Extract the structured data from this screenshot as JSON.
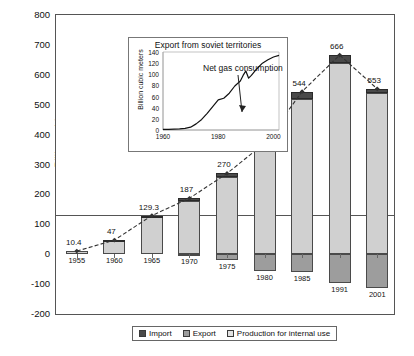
{
  "chart_data": {
    "type": "bar",
    "title": "",
    "xlabel": "",
    "ylabel": "Billion cubic meters",
    "ylim": [
      -200,
      800
    ],
    "yticks": [
      800,
      700,
      600,
      500,
      400,
      300,
      200,
      100,
      0,
      -100,
      -200
    ],
    "categories": [
      "1955",
      "1960",
      "1965",
      "1970",
      "1975",
      "1980",
      "1985",
      "1991",
      "2001"
    ],
    "grid": false,
    "legend_position": "bottom",
    "series": [
      {
        "name": "Production for internal use",
        "color": "#d0d0d0",
        "values": [
          10.4,
          45,
          126,
          178,
          258,
          355,
          520,
          640,
          540
        ]
      },
      {
        "name": "Import",
        "color": "#4a4a4a",
        "values": [
          0,
          2,
          3.3,
          9,
          12,
          16,
          24,
          26,
          13
        ]
      },
      {
        "name": "Export",
        "color": "#9d9d9d",
        "values": [
          0,
          0,
          0,
          -3,
          -19,
          -55,
          -60,
          -95,
          -113
        ]
      },
      {
        "name": "Net gas consumption",
        "color": "#333333",
        "values": [
          10.4,
          47,
          129.3,
          187,
          270,
          371,
          544,
          666,
          553
        ],
        "labels": [
          "10.4",
          "47",
          "129.3",
          "187",
          "270",
          "371",
          "544",
          "666",
          "553"
        ]
      }
    ],
    "annotations": [
      {
        "text": "Net gas consumption",
        "target": "net-consumption-line"
      }
    ],
    "inset": {
      "type": "line",
      "title": "Export from soviet territories",
      "ylabel": "Billion cubic meters",
      "xlabel": "",
      "ylim": [
        0,
        140
      ],
      "xlim": [
        1960,
        2002
      ],
      "yticks": [
        140,
        120,
        100,
        80,
        60,
        40,
        20,
        0
      ],
      "xticks": [
        "1960",
        "1980",
        "2000"
      ],
      "x": [
        1960,
        1962,
        1964,
        1966,
        1968,
        1970,
        1972,
        1974,
        1976,
        1978,
        1980,
        1982,
        1984,
        1986,
        1988,
        1989,
        1990,
        1991,
        1992,
        1994,
        1996,
        1998,
        2000,
        2002
      ],
      "y": [
        1,
        1,
        1.5,
        2,
        3,
        5,
        11,
        19,
        30,
        42,
        54,
        57,
        66,
        79,
        88,
        98,
        106,
        93,
        98,
        110,
        120,
        126,
        131,
        134
      ]
    }
  },
  "legend": {
    "items": [
      {
        "label": "Import",
        "color": "#4a4a4a"
      },
      {
        "label": "Export",
        "color": "#9d9d9d"
      },
      {
        "label": "Production for internal use",
        "color": "#e2e2e2"
      }
    ]
  }
}
